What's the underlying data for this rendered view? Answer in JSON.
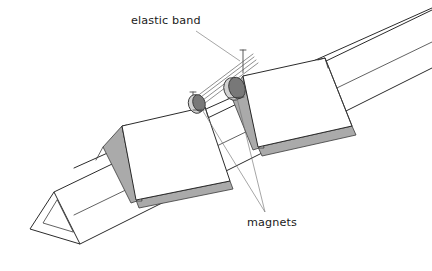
{
  "figure": {
    "title": "Elastic band and magnets on triangular prism",
    "width": 432,
    "height": 271,
    "background_color": "#ffffff",
    "drawing_type": "line-diagram"
  },
  "labels": {
    "elastic_band": {
      "text": "elastic band",
      "x": 131,
      "y": 24,
      "anchor": "start",
      "leader_from": [
        196,
        30
      ],
      "leader_to": [
        239,
        60
      ]
    },
    "magnets": {
      "text": "magnets",
      "x": 247,
      "y": 225,
      "anchor": "start",
      "leader_a_from": [
        265,
        212
      ],
      "leader_a_to": [
        200,
        105
      ],
      "leader_b_from": [
        265,
        212
      ],
      "leader_b_to": [
        236,
        93
      ]
    }
  },
  "colors": {
    "stroke": "#2b2b2b",
    "stroke_thin": "#3a3a3a",
    "face_white": "#ffffff",
    "shade_gray": "#aaaaaa",
    "shade_gray_light": "#c4c4c4",
    "magnet_fill": "#787878",
    "magnet_rim": "#d2d2d2",
    "leader": "#6a6a6a",
    "text": "#1a1a1a"
  },
  "parts": {
    "prism": {
      "name": "triangular prism body",
      "top_ridge": [
        [
          54,
          192
        ],
        [
          432,
          10
        ]
      ],
      "front_lower_edge": [
        [
          74,
          215
        ],
        [
          432,
          42
        ]
      ],
      "back_upper_edge": [
        [
          74,
          168
        ],
        [
          432,
          8
        ]
      ],
      "end_cap_outer": [
        [
          54,
          192
        ],
        [
          30,
          229
        ],
        [
          80,
          244
        ]
      ],
      "end_cap_inner": [
        [
          57,
          199
        ],
        [
          42,
          224
        ],
        [
          74,
          234
        ]
      ]
    },
    "flap_left": {
      "name": "left hinged flap",
      "face": [
        [
          122,
          125
        ],
        [
          205,
          107
        ],
        [
          230,
          182
        ],
        [
          136,
          200
        ]
      ],
      "shade_edge": [
        [
          136,
          200
        ],
        [
          230,
          182
        ],
        [
          232,
          188
        ],
        [
          138,
          206
        ]
      ],
      "hinge_wedge": [
        [
          104,
          146
        ],
        [
          122,
          125
        ],
        [
          136,
          200
        ],
        [
          130,
          202
        ]
      ]
    },
    "flap_right": {
      "name": "right hinged flap",
      "face": [
        [
          242,
          75
        ],
        [
          325,
          58
        ],
        [
          352,
          127
        ],
        [
          258,
          147
        ]
      ],
      "shade_edge": [
        [
          258,
          147
        ],
        [
          352,
          127
        ],
        [
          354,
          134
        ],
        [
          260,
          154
        ]
      ],
      "hinge_wedge": [
        [
          231,
          92
        ],
        [
          242,
          75
        ],
        [
          258,
          147
        ],
        [
          252,
          149
        ]
      ]
    },
    "magnet_left": {
      "name": "left magnet disc",
      "cx": 199,
      "cy": 103,
      "rx": 7,
      "ry": 9,
      "rotation": -18
    },
    "magnet_right": {
      "name": "right magnet disc",
      "cx": 237,
      "cy": 88,
      "rx": 9,
      "ry": 11,
      "rotation": -18
    },
    "elastic_band": {
      "name": "elastic band strands",
      "strand_count": 4,
      "from": [
        197,
        98
      ],
      "to": [
        252,
        56
      ],
      "pin_top": [
        243,
        52
      ],
      "pin_bottom": [
        243,
        72
      ]
    }
  }
}
